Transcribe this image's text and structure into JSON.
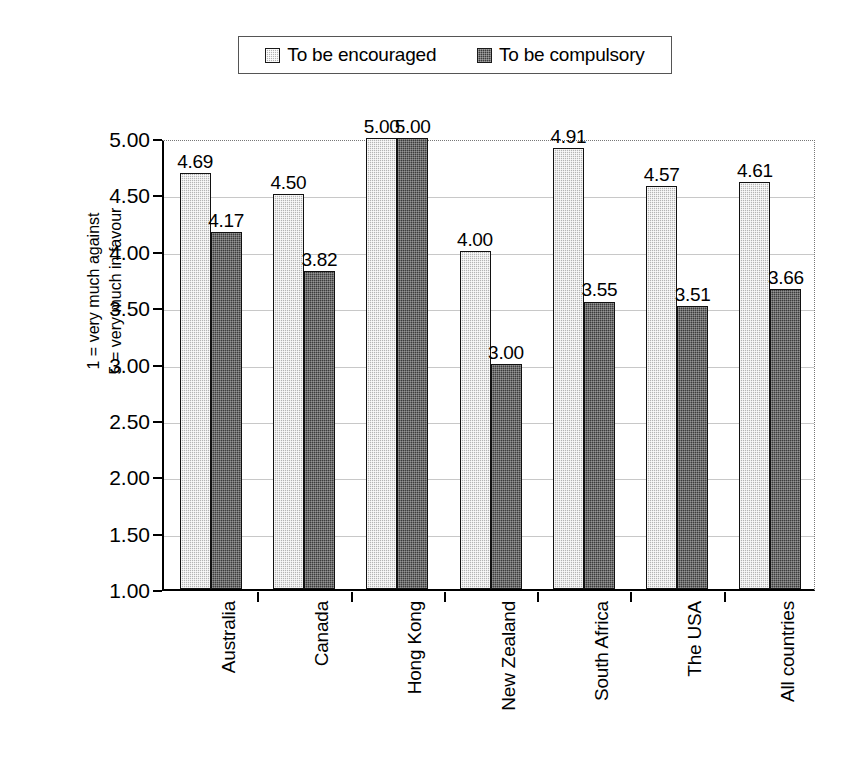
{
  "legend": {
    "position": "top-center",
    "entries": [
      {
        "label": "To be encouraged",
        "swatch": "light-hatched-swatch",
        "color": "#b4b4b4"
      },
      {
        "label": "To be compulsory",
        "swatch": "dark-hatched-swatch",
        "color": "#3c3c3c"
      }
    ]
  },
  "axis": {
    "y_title_line1": "1 = very much against",
    "y_title_line2": "5 = very much in favour",
    "y_ticks": [
      "5.00",
      "4.50",
      "4.00",
      "3.50",
      "3.00",
      "2.50",
      "2.00",
      "1.50",
      "1.00"
    ]
  },
  "chart_data": {
    "type": "bar",
    "title": "",
    "xlabel": "",
    "ylabel": "1 = very much against / 5 = very much in favour",
    "ylim": [
      1.0,
      5.0
    ],
    "ytick_step": 0.5,
    "grid": true,
    "legend_position": "top",
    "categories": [
      "Australia",
      "Canada",
      "Hong Kong",
      "New Zealand",
      "South Africa",
      "The USA",
      "All countries"
    ],
    "series": [
      {
        "name": "To be encouraged",
        "color": "#b4b4b4",
        "values": [
          4.69,
          4.5,
          5.0,
          4.0,
          4.91,
          4.57,
          4.61
        ],
        "labels": [
          "4.69",
          "4.50",
          "5.00",
          "4.00",
          "4.91",
          "4.57",
          "4.61"
        ]
      },
      {
        "name": "To be compulsory",
        "color": "#3c3c3c",
        "values": [
          4.17,
          3.82,
          5.0,
          3.0,
          3.55,
          3.51,
          3.66
        ],
        "labels": [
          "4.17",
          "3.82",
          "5.00",
          "3.00",
          "3.55",
          "3.51",
          "3.66"
        ]
      }
    ]
  }
}
